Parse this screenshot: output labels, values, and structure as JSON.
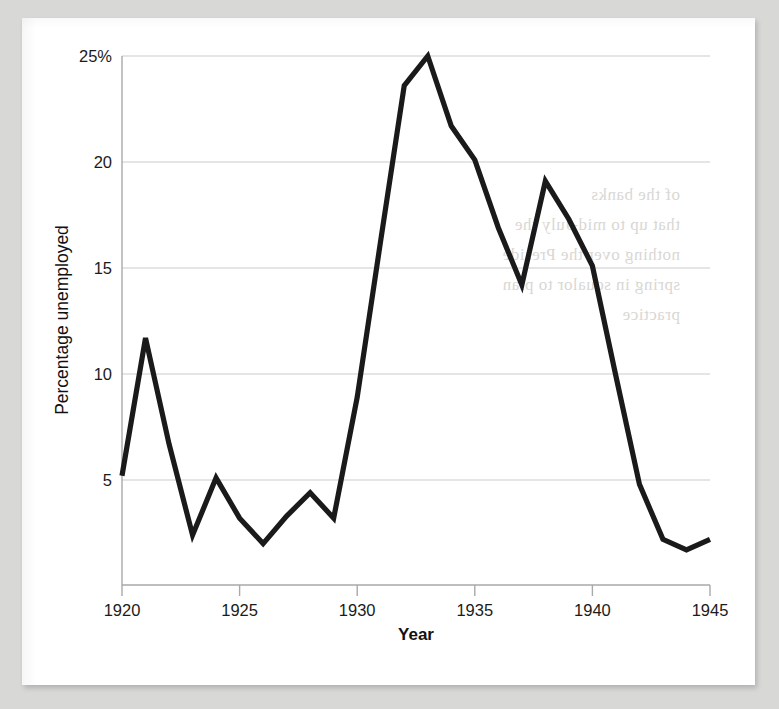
{
  "page": {
    "background_color": "#d8d8d6",
    "sheet_color": "#ffffff",
    "bleed_through_text": "of the banks\nthat up to mid-July the\nnothing over the Preside\nspring in squalor to plan\npractice"
  },
  "chart_data": {
    "type": "line",
    "title": "",
    "xlabel": "Year",
    "ylabel": "Percentage unemployed",
    "xlim": [
      1920,
      1945
    ],
    "ylim": [
      0,
      25
    ],
    "grid": true,
    "legend": "none",
    "line_color": "#1a1a1a",
    "gridline_color": "#cccccc",
    "x_ticks": [
      "1920",
      "1925",
      "1930",
      "1935",
      "1940",
      "1945"
    ],
    "x_tick_values": [
      1920,
      1925,
      1930,
      1935,
      1940,
      1945
    ],
    "y_ticks": [
      "5",
      "10",
      "15",
      "20",
      "25%"
    ],
    "y_tick_values": [
      5,
      10,
      15,
      20,
      25
    ],
    "x": [
      1920,
      1921,
      1922,
      1923,
      1924,
      1925,
      1926,
      1927,
      1928,
      1929,
      1930,
      1931,
      1932,
      1933,
      1934,
      1935,
      1936,
      1937,
      1938,
      1939,
      1940,
      1941,
      1942,
      1943,
      1944,
      1945
    ],
    "values": [
      5.2,
      11.7,
      6.7,
      2.4,
      5.1,
      3.2,
      2.0,
      3.3,
      4.4,
      3.2,
      8.9,
      16.3,
      23.6,
      25.0,
      21.7,
      20.1,
      16.9,
      14.2,
      19.1,
      17.3,
      15.1,
      9.9,
      4.8,
      2.2,
      1.7,
      2.2
    ],
    "series": [
      {
        "name": "Percentage unemployed",
        "values": [
          5.2,
          11.7,
          6.7,
          2.4,
          5.1,
          3.2,
          2.0,
          3.3,
          4.4,
          3.2,
          8.9,
          16.3,
          23.6,
          25.0,
          21.7,
          20.1,
          16.9,
          14.2,
          19.1,
          17.3,
          15.1,
          9.9,
          4.8,
          2.2,
          1.7,
          2.2
        ]
      }
    ]
  }
}
